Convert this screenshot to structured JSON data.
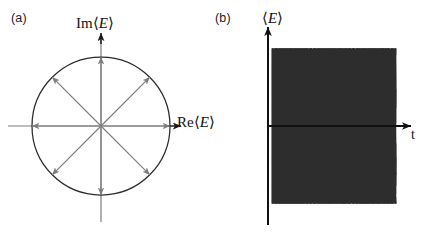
{
  "figure": {
    "caption_free": true,
    "panels": [
      {
        "id": "a",
        "label": "(a)",
        "kind": "phasor-diagram",
        "description": "Complex-plane phasor diagram: unit circle with eight equally spaced arrows from the origin",
        "axes": {
          "x_label_prefix": "Re",
          "x_label_bracket_open": "⟨",
          "x_label_symbol": "E",
          "x_label_bracket_close": "⟩",
          "y_label_prefix": "Im",
          "y_label_bracket_open": "⟨",
          "y_label_symbol": "E",
          "y_label_bracket_close": "⟩"
        },
        "geometry": {
          "center_x": 101,
          "center_y": 126,
          "radius": 69,
          "x_axis_start": 8,
          "x_axis_end": 180,
          "y_axis_top": 33,
          "y_axis_bottom": 222
        },
        "phasor_angles_deg": [
          0,
          45,
          90,
          135,
          180,
          225,
          270,
          315
        ],
        "phasor_count": 8,
        "colors": {
          "circle": "#2b2b2b",
          "axis": "#7d7d7d",
          "axis_arrow": "#1a1a1a",
          "phasor": "#7d7d7d"
        }
      },
      {
        "id": "b",
        "label": "(b)",
        "kind": "time-series-band",
        "description": "Many superposed sinusoids with random phases forming a dense oscillating band versus time",
        "axes": {
          "y_label_bracket_open": "⟨",
          "y_label_symbol": "E",
          "y_label_bracket_close": "⟩",
          "x_label_symbol": "t"
        },
        "geometry": {
          "y_axis_x": 53,
          "y_axis_top": 27,
          "y_axis_bottom": 225,
          "x_axis_y": 126,
          "x_axis_start": 53,
          "x_axis_end": 196,
          "band_left": 57,
          "band_right": 181,
          "band_top": 45,
          "band_bottom": 200
        },
        "colors": {
          "axis": "#111111",
          "wave": "#2e2e2e"
        }
      }
    ]
  },
  "chart_data": {
    "type": "line",
    "title": "",
    "panels": [
      {
        "id": "a",
        "type": "scatter",
        "title": "(a)",
        "xlabel": "Re⟨E⟩",
        "ylabel": "Im⟨E⟩",
        "xlim": [
          -1.3,
          1.3
        ],
        "ylim": [
          -1.4,
          1.4
        ],
        "grid": false,
        "legend": "none",
        "series": [
          {
            "name": "phasors",
            "angles_deg": [
              0,
              45,
              90,
              135,
              180,
              225,
              270,
              315
            ],
            "amplitude": 1.0,
            "x": [
              1.0,
              0.7071,
              0.0,
              -0.7071,
              -1.0,
              -0.7071,
              0.0,
              0.7071
            ],
            "y": [
              0.0,
              0.7071,
              1.0,
              0.7071,
              0.0,
              -0.7071,
              -1.0,
              -0.7071
            ]
          },
          {
            "name": "unit-circle",
            "radius": 1.0
          }
        ]
      },
      {
        "id": "b",
        "type": "line",
        "title": "(b)",
        "xlabel": "t",
        "ylabel": "⟨E⟩",
        "xlim": [
          0,
          1
        ],
        "ylim": [
          -1.15,
          1.15
        ],
        "grid": false,
        "legend": "none",
        "n_waves": 28,
        "cycles_across_axis": 21,
        "amplitude": 1.0,
        "phases_deg": [
          0,
          13,
          26,
          39,
          51,
          64,
          77,
          90,
          103,
          116,
          129,
          141,
          154,
          167,
          180,
          193,
          206,
          219,
          231,
          244,
          257,
          270,
          283,
          296,
          309,
          321,
          334,
          347
        ]
      }
    ]
  }
}
